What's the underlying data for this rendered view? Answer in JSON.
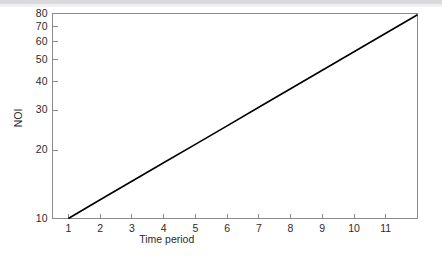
{
  "figure": {
    "background_color": "#ffffff",
    "top_band_color": "#d9d9dc",
    "line_color": "#000000",
    "axis_color": "#8a8a8e",
    "text_color": "#2b2b2b"
  },
  "chart_data": {
    "type": "line",
    "title": "",
    "subtitle": "",
    "xlabel": "Time period",
    "ylabel": "NOI",
    "yscale": "log",
    "xscale": "linear",
    "grid": false,
    "legend": null,
    "legend_position": "none",
    "xlim": [
      0.5,
      12.0
    ],
    "ylim": [
      10,
      80
    ],
    "xticks": [
      1,
      2,
      3,
      4,
      5,
      6,
      7,
      8,
      9,
      10,
      11
    ],
    "xtick_labels": [
      "1",
      "2",
      "3",
      "4",
      "5",
      "6",
      "7",
      "8",
      "9",
      "10",
      "11"
    ],
    "yticks": [
      10,
      20,
      30,
      40,
      50,
      60,
      70,
      80
    ],
    "ytick_labels": [
      "10",
      "20",
      "30",
      "40",
      "50",
      "60",
      "70",
      "80"
    ],
    "series": [
      {
        "name": "NOI",
        "color": "#000000",
        "x": [
          1,
          2,
          3,
          4,
          5,
          6,
          7,
          8,
          9,
          10,
          11,
          12
        ],
        "values": [
          10.0,
          12.1,
          14.6,
          17.6,
          21.2,
          25.6,
          30.9,
          37.3,
          45.0,
          54.3,
          65.5,
          79.0
        ]
      }
    ],
    "annotations": []
  }
}
